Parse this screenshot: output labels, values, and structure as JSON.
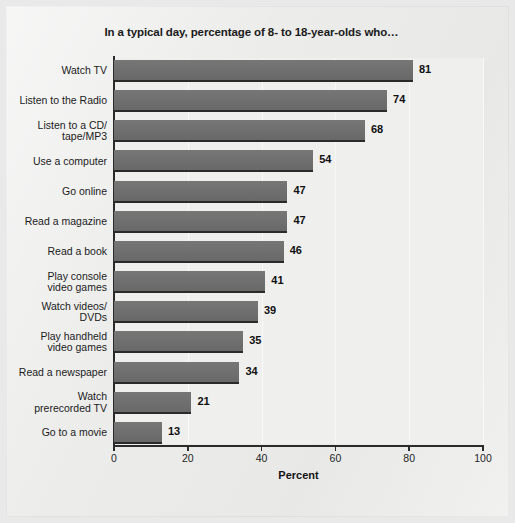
{
  "page": {
    "background_color": "#e9e9e9",
    "paper_color": "#ececeb"
  },
  "chart_data": {
    "type": "bar",
    "orientation": "horizontal",
    "title": "In a typical day, percentage of 8- to 18-year-olds who…",
    "xlabel": "Percent",
    "ylabel": "",
    "xlim": [
      0,
      100
    ],
    "xticks": [
      0,
      20,
      40,
      60,
      80,
      100
    ],
    "xticklabels": [
      "0",
      "20",
      "40",
      "60",
      "80",
      "100"
    ],
    "grid": true,
    "grid_axis": "x",
    "legend": null,
    "bar_color": "#6f6f6f",
    "value_label_color": "#101010",
    "categories": [
      "Watch TV",
      "Listen to the Radio",
      "Listen to a CD/\ntape/MP3",
      "Use a computer",
      "Go online",
      "Read a magazine",
      "Read a book",
      "Play console\nvideo games",
      "Watch videos/\nDVDs",
      "Play handheld\nvideo games",
      "Read a newspaper",
      "Watch\nprerecorded TV",
      "Go to a movie"
    ],
    "values": [
      81,
      74,
      68,
      54,
      47,
      47,
      46,
      41,
      39,
      35,
      34,
      21,
      13
    ],
    "value_labels": [
      "81",
      "74",
      "68",
      "54",
      "47",
      "47",
      "46",
      "41",
      "39",
      "35",
      "34",
      "21",
      "13"
    ]
  }
}
